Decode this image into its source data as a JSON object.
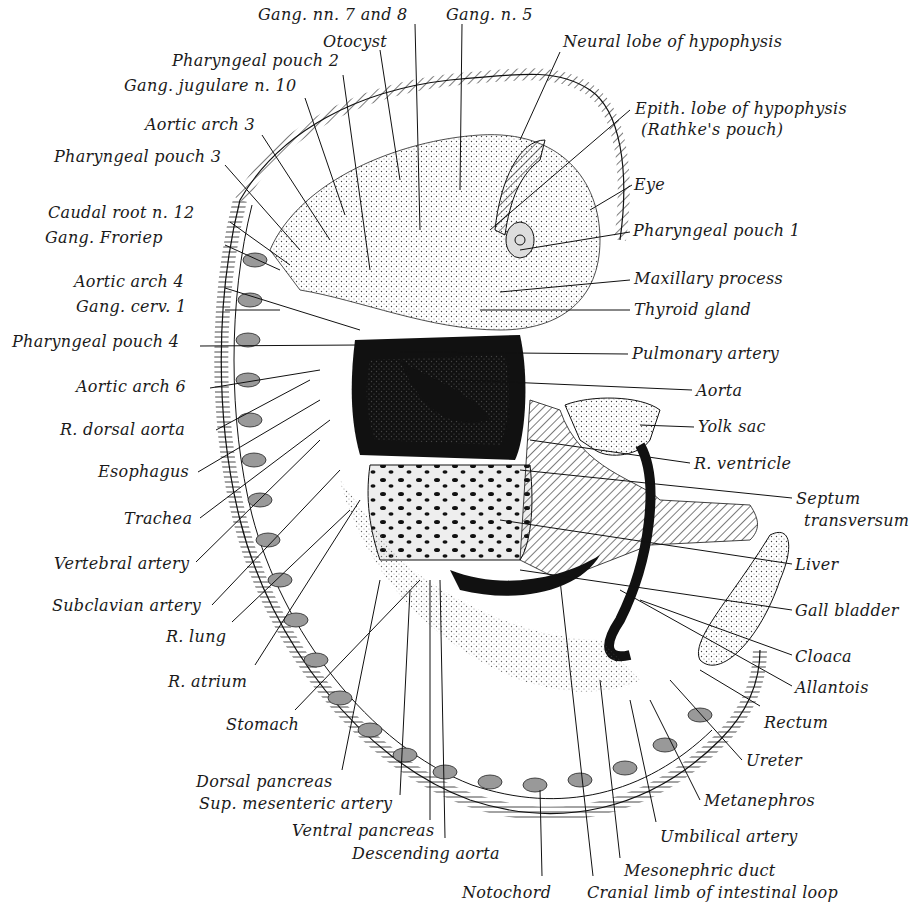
{
  "figure": {
    "labels_top": [
      {
        "id": "gang-nn-7-8",
        "text": "Gang. nn. 7 and 8",
        "x": 258,
        "y": 6
      },
      {
        "id": "gang-n-5",
        "text": "Gang. n. 5",
        "x": 446,
        "y": 6
      },
      {
        "id": "otocyst",
        "text": "Otocyst",
        "x": 323,
        "y": 33
      },
      {
        "id": "neural-lobe",
        "text": "Neural lobe of hypophysis",
        "x": 563,
        "y": 33
      },
      {
        "id": "pharyngeal-pouch-2",
        "text": "Pharyngeal pouch 2",
        "x": 172,
        "y": 52
      },
      {
        "id": "gang-jugulare",
        "text": "Gang. jugulare n. 10",
        "x": 124,
        "y": 77
      },
      {
        "id": "epith-lobe",
        "text": "Epith. lobe of hypophysis",
        "x": 635,
        "y": 100
      },
      {
        "id": "rathkes-pouch",
        "text": "(Rathke's pouch)",
        "x": 641,
        "y": 121
      },
      {
        "id": "aortic-arch-3",
        "text": "Aortic arch 3",
        "x": 145,
        "y": 116
      }
    ],
    "labels_left": [
      {
        "id": "pharyngeal-pouch-3",
        "text": "Pharyngeal pouch 3",
        "x": 54,
        "y": 148
      },
      {
        "id": "caudal-root",
        "text": "Caudal root n. 12",
        "x": 48,
        "y": 204
      },
      {
        "id": "gang-froriep",
        "text": "Gang. Froriep",
        "x": 45,
        "y": 229
      },
      {
        "id": "aortic-arch-4",
        "text": "Aortic arch 4",
        "x": 74,
        "y": 273
      },
      {
        "id": "gang-cerv",
        "text": "Gang. cerv. 1",
        "x": 76,
        "y": 298
      },
      {
        "id": "pharyngeal-pouch-4",
        "text": "Pharyngeal pouch 4",
        "x": 12,
        "y": 333
      },
      {
        "id": "aortic-arch-6",
        "text": "Aortic arch 6",
        "x": 76,
        "y": 378
      },
      {
        "id": "r-dorsal-aorta",
        "text": "R. dorsal aorta",
        "x": 60,
        "y": 421
      },
      {
        "id": "esophagus",
        "text": "Esophagus",
        "x": 98,
        "y": 463
      },
      {
        "id": "trachea",
        "text": "Trachea",
        "x": 124,
        "y": 510
      },
      {
        "id": "vertebral-artery",
        "text": "Vertebral artery",
        "x": 54,
        "y": 555
      },
      {
        "id": "subclavian-artery",
        "text": "Subclavian artery",
        "x": 52,
        "y": 597
      },
      {
        "id": "r-lung",
        "text": "R. lung",
        "x": 166,
        "y": 628
      },
      {
        "id": "r-atrium",
        "text": "R. atrium",
        "x": 168,
        "y": 673
      },
      {
        "id": "stomach",
        "text": "Stomach",
        "x": 226,
        "y": 716
      }
    ],
    "labels_right": [
      {
        "id": "eye",
        "text": "Eye",
        "x": 634,
        "y": 176
      },
      {
        "id": "pharyngeal-pouch-1",
        "text": "Pharyngeal pouch 1",
        "x": 633,
        "y": 222
      },
      {
        "id": "maxillary-process",
        "text": "Maxillary process",
        "x": 634,
        "y": 270
      },
      {
        "id": "thyroid-gland",
        "text": "Thyroid gland",
        "x": 634,
        "y": 301
      },
      {
        "id": "pulmonary-artery",
        "text": "Pulmonary artery",
        "x": 632,
        "y": 345
      },
      {
        "id": "aorta",
        "text": "Aorta",
        "x": 696,
        "y": 382
      },
      {
        "id": "yolk-sac",
        "text": "Yolk sac",
        "x": 698,
        "y": 418
      },
      {
        "id": "r-ventricle",
        "text": "R. ventricle",
        "x": 694,
        "y": 455
      },
      {
        "id": "septum",
        "text": "Septum",
        "x": 796,
        "y": 490
      },
      {
        "id": "transversum",
        "text": "transversum",
        "x": 804,
        "y": 512
      },
      {
        "id": "liver",
        "text": "Liver",
        "x": 795,
        "y": 556
      },
      {
        "id": "gall-bladder",
        "text": "Gall bladder",
        "x": 795,
        "y": 602
      },
      {
        "id": "cloaca",
        "text": "Cloaca",
        "x": 795,
        "y": 648
      },
      {
        "id": "allantois",
        "text": "Allantois",
        "x": 795,
        "y": 679
      },
      {
        "id": "rectum",
        "text": "Rectum",
        "x": 764,
        "y": 714
      },
      {
        "id": "ureter",
        "text": "Ureter",
        "x": 746,
        "y": 752
      },
      {
        "id": "metanephros",
        "text": "Metanephros",
        "x": 704,
        "y": 792
      },
      {
        "id": "umbilical-artery",
        "text": "Umbilical artery",
        "x": 660,
        "y": 828
      }
    ],
    "labels_bottom": [
      {
        "id": "dorsal-pancreas",
        "text": "Dorsal pancreas",
        "x": 196,
        "y": 773
      },
      {
        "id": "sup-mesenteric",
        "text": "Sup. mesenteric artery",
        "x": 199,
        "y": 795
      },
      {
        "id": "ventral-pancreas",
        "text": "Ventral pancreas",
        "x": 292,
        "y": 822
      },
      {
        "id": "descending-aorta",
        "text": "Descending aorta",
        "x": 352,
        "y": 845
      },
      {
        "id": "mesonephric-duct",
        "text": "Mesonephric duct",
        "x": 624,
        "y": 862
      },
      {
        "id": "notochord",
        "text": "Notochord",
        "x": 462,
        "y": 884
      },
      {
        "id": "cranial-limb",
        "text": "Cranial limb of intestinal loop",
        "x": 587,
        "y": 884
      }
    ]
  }
}
